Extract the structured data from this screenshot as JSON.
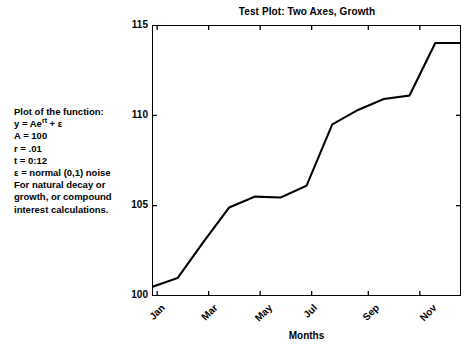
{
  "chart_data": {
    "type": "line",
    "title": "Test Plot: Two Axes, Growth",
    "xlabel": "Months",
    "ylabel": "",
    "xlim": [
      0,
      12
    ],
    "ylim": [
      100,
      115
    ],
    "grid": false,
    "legend": null,
    "x": [
      0,
      1,
      2,
      3,
      4,
      5,
      6,
      7,
      8,
      9,
      10,
      11,
      12
    ],
    "values": [
      100.5,
      101.0,
      103.0,
      104.9,
      105.5,
      105.45,
      106.1,
      109.5,
      110.3,
      110.9,
      111.1,
      114.0,
      114.0
    ],
    "series": [
      {
        "name": "y = Ae^rt + e",
        "color": "#000000",
        "values": [
          100.5,
          101.0,
          103.0,
          104.9,
          105.5,
          105.45,
          106.1,
          109.5,
          110.3,
          110.9,
          111.1,
          114.0,
          114.0
        ]
      }
    ],
    "y_ticks": [
      100,
      105,
      110,
      115
    ],
    "y_tick_labels": [
      "100",
      "105",
      "110",
      "115"
    ],
    "x_ticks": [
      0.2,
      2.2,
      4.2,
      6.2,
      8.4,
      10.4
    ],
    "x_tick_labels": [
      "Jan",
      "Mar",
      "May",
      "Jul",
      "Sep",
      "Nov"
    ],
    "annotation_lines": [
      "Plot of the function:",
      "y = Aeʳᵗ + ε",
      "A = 100",
      "r = .01",
      "t = 0:12",
      "ε = normal (0,1) noise",
      "For natural decay or",
      "growth, or compound",
      "interest calculations."
    ]
  },
  "figure": {
    "title": "Test Plot: Two Axes, Growth",
    "xaxis_title": "Months",
    "background": "#ffffff",
    "line_color": "#000000",
    "axis_color": "#000000"
  },
  "annotation": {
    "line_1": "Plot of the function:",
    "line_2_prefix": "y = Ae",
    "line_2_sup": "rt",
    "line_2_suffix": " + ε",
    "line_3": "A = 100",
    "line_4": "r = .01",
    "line_5": "t = 0:12",
    "line_6": "ε = normal (0,1) noise",
    "line_7": "For natural decay or",
    "line_8": "growth, or compound",
    "line_9": "interest calculations."
  },
  "yticks": {
    "t115": "115",
    "t110": "110",
    "t105": "105",
    "t100": "100"
  },
  "xticks": {
    "jan": "Jan",
    "mar": "Mar",
    "may": "May",
    "jul": "Jul",
    "sep": "Sep",
    "nov": "Nov"
  }
}
